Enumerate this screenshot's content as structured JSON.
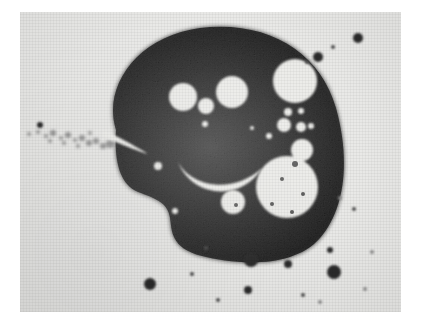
{
  "image": {
    "kind": "micrograph",
    "title_text": "",
    "caption_text": "",
    "background_color": "#ffffff",
    "plate_color": "#e9e9e7",
    "specimen_color": "#2e2e2e",
    "vacuole_color": "#ebebe8",
    "speck_color": "#2b2b2b",
    "plate": {
      "x": 20,
      "y": 12,
      "width": 381,
      "height": 300
    }
  },
  "specimen": {
    "name": "dark-amoeboid-mass",
    "description_text": "",
    "outline": "M 96 118 C 82 74 118 24 180 16 C 248 8 300 40 316 96 C 330 146 326 196 300 226 C 272 258 214 252 182 244 C 150 236 152 218 150 206 C 148 190 134 186 118 180 C 100 172 94 150 96 118 Z"
  },
  "vacuoles": [
    {
      "name": "vacuole-eye-left",
      "cx": 163,
      "cy": 85,
      "r": 14
    },
    {
      "name": "vacuole-eye-right",
      "cx": 212,
      "cy": 80,
      "r": 16
    },
    {
      "name": "vacuole-nose-center",
      "cx": 186,
      "cy": 94,
      "r": 8
    },
    {
      "name": "vacuole-nose-tiny",
      "cx": 185,
      "cy": 112,
      "r": 3
    },
    {
      "name": "vacuole-top-right-large",
      "cx": 275,
      "cy": 69,
      "r": 22
    },
    {
      "name": "vacuole-cluster-a",
      "cx": 268,
      "cy": 100,
      "r": 4
    },
    {
      "name": "vacuole-cluster-b",
      "cx": 281,
      "cy": 99,
      "r": 3
    },
    {
      "name": "vacuole-cluster-c",
      "cx": 264,
      "cy": 113,
      "r": 7
    },
    {
      "name": "vacuole-cluster-d",
      "cx": 281,
      "cy": 115,
      "r": 5
    },
    {
      "name": "vacuole-cluster-e",
      "cx": 291,
      "cy": 114,
      "r": 3
    },
    {
      "name": "vacuole-cluster-f",
      "cx": 249,
      "cy": 124,
      "r": 3
    },
    {
      "name": "vacuole-mid-right",
      "cx": 282,
      "cy": 138,
      "r": 11
    },
    {
      "name": "vacuole-bottom-large",
      "cx": 267,
      "cy": 175,
      "r": 31
    },
    {
      "name": "vacuole-bottom-small",
      "cx": 213,
      "cy": 190,
      "r": 12
    },
    {
      "name": "vacuole-edge-left-small",
      "cx": 138,
      "cy": 154,
      "r": 4
    },
    {
      "name": "vacuole-edge-bottom",
      "cx": 155,
      "cy": 199,
      "r": 3
    },
    {
      "name": "vacuole-edge-dot",
      "cx": 232,
      "cy": 116,
      "r": 2
    }
  ],
  "vacuole_inner_dots": [
    {
      "cx": 275,
      "cy": 152,
      "r": 3
    },
    {
      "cx": 262,
      "cy": 167,
      "r": 2
    },
    {
      "cx": 283,
      "cy": 182,
      "r": 2
    },
    {
      "cx": 252,
      "cy": 192,
      "r": 2
    },
    {
      "cx": 272,
      "cy": 200,
      "r": 2
    },
    {
      "cx": 216,
      "cy": 193,
      "r": 2
    }
  ],
  "streaks": [
    {
      "name": "streak-diagonal-left",
      "path": "M 84 118 C 96 124 112 132 128 142 C 120 140 100 132 82 124 Z"
    },
    {
      "name": "streak-smile-arc",
      "path": "M 158 150 C 172 176 214 182 242 156 C 222 190 172 186 158 150 Z"
    }
  ],
  "background_specks": [
    {
      "name": "speck-top-right-1",
      "cx": 338,
      "cy": 26,
      "r": 5,
      "tone": "dark"
    },
    {
      "name": "speck-top-right-2",
      "cx": 298,
      "cy": 45,
      "r": 5,
      "tone": "dark"
    },
    {
      "name": "speck-top-right-3",
      "cx": 313,
      "cy": 35,
      "r": 2,
      "tone": "soft"
    },
    {
      "name": "speck-top-right-4",
      "cx": 287,
      "cy": 50,
      "r": 2,
      "tone": "soft"
    },
    {
      "name": "speck-left-edge",
      "cx": 20,
      "cy": 113,
      "r": 3,
      "tone": "dark"
    },
    {
      "name": "speck-bottom-1",
      "cx": 231,
      "cy": 248,
      "r": 7,
      "tone": "dark"
    },
    {
      "name": "speck-bottom-2",
      "cx": 268,
      "cy": 252,
      "r": 4,
      "tone": "dark"
    },
    {
      "name": "speck-bottom-3",
      "cx": 310,
      "cy": 238,
      "r": 3,
      "tone": "dark"
    },
    {
      "name": "speck-bottom-4",
      "cx": 314,
      "cy": 260,
      "r": 7,
      "tone": "dark"
    },
    {
      "name": "speck-bottom-5",
      "cx": 130,
      "cy": 272,
      "r": 6,
      "tone": "dark"
    },
    {
      "name": "speck-bottom-6",
      "cx": 228,
      "cy": 278,
      "r": 4,
      "tone": "dark"
    },
    {
      "name": "speck-bottom-7",
      "cx": 198,
      "cy": 288,
      "r": 2,
      "tone": "soft"
    },
    {
      "name": "speck-bottom-8",
      "cx": 172,
      "cy": 262,
      "r": 2,
      "tone": "soft"
    },
    {
      "name": "speck-bottom-9",
      "cx": 283,
      "cy": 283,
      "r": 2,
      "tone": "soft"
    },
    {
      "name": "speck-bottom-10",
      "cx": 300,
      "cy": 290,
      "r": 2,
      "tone": "faint"
    },
    {
      "name": "speck-bottom-11",
      "cx": 345,
      "cy": 277,
      "r": 2,
      "tone": "faint"
    },
    {
      "name": "speck-mid-right-1",
      "cx": 334,
      "cy": 197,
      "r": 2,
      "tone": "soft"
    },
    {
      "name": "speck-mid-right-2",
      "cx": 320,
      "cy": 186,
      "r": 2,
      "tone": "faint"
    },
    {
      "name": "speck-mid-right-3",
      "cx": 352,
      "cy": 240,
      "r": 2,
      "tone": "faint"
    },
    {
      "name": "speck-inside-low",
      "cx": 186,
      "cy": 236,
      "r": 2,
      "tone": "soft"
    }
  ],
  "scatter_trail": [
    {
      "cx": 9,
      "cy": 122,
      "r": 2
    },
    {
      "cx": 18,
      "cy": 120,
      "r": 2
    },
    {
      "cx": 26,
      "cy": 124,
      "r": 2
    },
    {
      "cx": 33,
      "cy": 121,
      "r": 3
    },
    {
      "cx": 41,
      "cy": 126,
      "r": 2
    },
    {
      "cx": 48,
      "cy": 123,
      "r": 3
    },
    {
      "cx": 55,
      "cy": 128,
      "r": 2
    },
    {
      "cx": 62,
      "cy": 126,
      "r": 3
    },
    {
      "cx": 69,
      "cy": 131,
      "r": 3
    },
    {
      "cx": 76,
      "cy": 129,
      "r": 3
    },
    {
      "cx": 83,
      "cy": 134,
      "r": 3
    },
    {
      "cx": 90,
      "cy": 132,
      "r": 4
    },
    {
      "cx": 58,
      "cy": 134,
      "r": 2
    },
    {
      "cx": 44,
      "cy": 131,
      "r": 2
    },
    {
      "cx": 30,
      "cy": 129,
      "r": 2
    },
    {
      "cx": 70,
      "cy": 121,
      "r": 2
    }
  ]
}
